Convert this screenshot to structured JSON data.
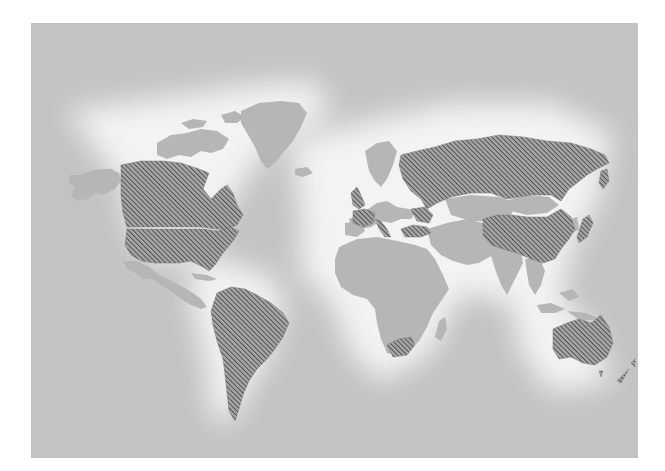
{
  "map": {
    "type": "world-choropleth",
    "projection": "miller-like",
    "legend": null,
    "title": null,
    "colors": {
      "ocean": "#c3c3c3",
      "glow": "#f4f4f4",
      "land": "#b6b6b6",
      "hatch_line": "#3e3e3e",
      "hatch_bg": "#9a9a9a",
      "frame_border": "#ffffff"
    },
    "fill_style": {
      "highlighted": "diagonal-hatch",
      "default": "solid-gray"
    },
    "highlighted_regions": [
      "Canada",
      "United States",
      "South America",
      "United Kingdom",
      "France",
      "Italy",
      "Ukraine",
      "Turkey",
      "Russia",
      "China",
      "Japan",
      "South Africa",
      "Australia",
      "New Zealand"
    ],
    "unhighlighted_regions": [
      "Alaska",
      "Canadian Arctic Archipelago",
      "Greenland",
      "Mexico & Central America",
      "Iberia & rest of Europe",
      "Scandinavia",
      "Africa",
      "Middle East",
      "Central Asia",
      "Mongolia",
      "India & South Asia",
      "Southeast Asia & Indonesia",
      "Korea",
      "Madagascar"
    ]
  }
}
